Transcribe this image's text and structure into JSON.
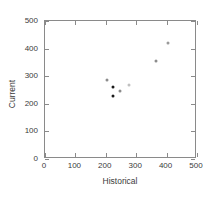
{
  "chart_data": {
    "type": "scatter",
    "title": "",
    "xlabel": "Historical",
    "ylabel": "Current",
    "xlim": [
      0,
      500
    ],
    "ylim": [
      0,
      500
    ],
    "xticks": [
      0,
      100,
      200,
      300,
      400,
      500
    ],
    "yticks": [
      0,
      100,
      200,
      300,
      400,
      500
    ],
    "grid": false,
    "legend": "none",
    "frame": "box",
    "tick_direction": "in",
    "points": [
      {
        "x": 204,
        "y": 286,
        "color": "#8c8c8c"
      },
      {
        "x": 225,
        "y": 261,
        "color": "#1a1a1a"
      },
      {
        "x": 225,
        "y": 228,
        "color": "#1a1a1a"
      },
      {
        "x": 247,
        "y": 246,
        "color": "#8c8c8c"
      },
      {
        "x": 275,
        "y": 268,
        "color": "#c0c0c0"
      },
      {
        "x": 365,
        "y": 355,
        "color": "#8c8c8c"
      },
      {
        "x": 405,
        "y": 420,
        "color": "#9a9a9a"
      }
    ]
  },
  "axis": {
    "x_tick_labels": [
      "0",
      "100",
      "200",
      "300",
      "400",
      "500"
    ],
    "y_tick_labels": [
      "0",
      "100",
      "200",
      "300",
      "400",
      "500"
    ],
    "x_title": "Historical",
    "y_title": "Current"
  },
  "colors": {
    "frame": "#8a8a8a",
    "text": "#3b3b3b",
    "marker_dark": "#1a1a1a",
    "marker_gray": "#8c8c8c",
    "marker_light": "#c0c0c0",
    "background": "#ffffff"
  }
}
